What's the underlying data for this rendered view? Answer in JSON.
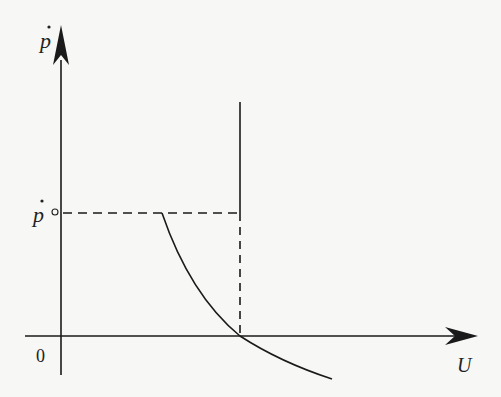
{
  "diagram": {
    "y_axis_label": "p",
    "y_axis_label_dot": "·",
    "x_axis_label": "U",
    "origin_label": "0",
    "p_level_label": "p",
    "p_level_marker": "°",
    "colors": {
      "line": "#1a1a1a",
      "background": "#f7f7f5"
    },
    "elements": [
      "y-axis arrow",
      "x-axis arrow",
      "vertical long-run line",
      "dashed horizontal at p-dot-zero",
      "dashed vertical to natural rate",
      "downward sloping curve"
    ]
  }
}
